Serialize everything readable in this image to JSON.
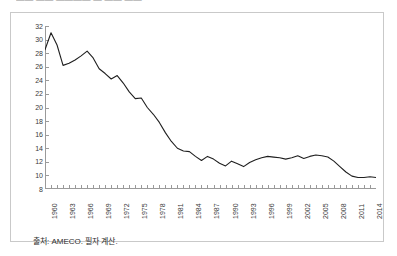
{
  "figure": {
    "title_fragment": "—— —— ———— — —— ——",
    "source_note": "출처: AMECO. 필자 계산."
  },
  "chart_data": {
    "type": "line",
    "title": "",
    "xlabel": "",
    "ylabel": "",
    "xlim": [
      1960,
      2015
    ],
    "ylim": [
      8,
      32
    ],
    "ytick_step": 2,
    "yticks": [
      8,
      10,
      12,
      14,
      16,
      18,
      20,
      22,
      24,
      26,
      28,
      30,
      32
    ],
    "xticks": [
      1960,
      1963,
      1966,
      1969,
      1972,
      1975,
      1978,
      1981,
      1984,
      1987,
      1990,
      1993,
      1996,
      1999,
      2002,
      2005,
      2008,
      2011,
      2014
    ],
    "grid": false,
    "legend": null,
    "line_color": "#1f1f1f",
    "series": [
      {
        "name": "series-1",
        "x": [
          1960,
          1961,
          1962,
          1963,
          1964,
          1965,
          1966,
          1967,
          1968,
          1969,
          1970,
          1971,
          1972,
          1973,
          1974,
          1975,
          1976,
          1977,
          1978,
          1979,
          1980,
          1981,
          1982,
          1983,
          1984,
          1985,
          1986,
          1987,
          1988,
          1989,
          1990,
          1991,
          1992,
          1993,
          1994,
          1995,
          1996,
          1997,
          1998,
          1999,
          2000,
          2001,
          2002,
          2003,
          2004,
          2005,
          2006,
          2007,
          2008,
          2009,
          2010,
          2011,
          2012,
          2013,
          2014,
          2015
        ],
        "values": [
          28.5,
          31.0,
          29.2,
          26.2,
          26.5,
          27.0,
          27.6,
          28.3,
          27.3,
          25.7,
          25.0,
          24.2,
          24.7,
          23.6,
          22.3,
          21.3,
          21.4,
          20.0,
          19.0,
          17.8,
          16.3,
          15.0,
          14.0,
          13.6,
          13.5,
          12.8,
          12.2,
          12.8,
          12.4,
          11.8,
          11.4,
          12.1,
          11.7,
          11.3,
          11.9,
          12.3,
          12.6,
          12.8,
          12.7,
          12.6,
          12.4,
          12.6,
          12.9,
          12.5,
          12.8,
          13.0,
          12.9,
          12.7,
          12.1,
          11.3,
          10.5,
          9.9,
          9.7,
          9.7,
          9.8,
          9.7
        ]
      }
    ]
  }
}
